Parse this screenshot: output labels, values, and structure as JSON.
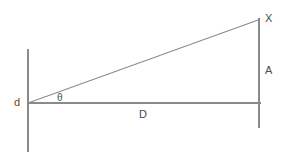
{
  "diagram": {
    "type": "geometry-diagram",
    "canvas": {
      "width": 286,
      "height": 161,
      "background": "#ffffff"
    },
    "stroke_color": "#878787",
    "text_color": "#4c4c4c",
    "labels": {
      "observer": "d",
      "angle": "θ",
      "distance": "D",
      "size": "A",
      "object": "X"
    },
    "geometry": {
      "vertex": {
        "x": 28,
        "y": 103
      },
      "apex": {
        "x": 259,
        "y": 20
      },
      "base_end": {
        "x": 260,
        "y": 103
      },
      "left_axis": {
        "x": 28,
        "y1": 49,
        "y2": 152
      },
      "right_axis": {
        "x": 259,
        "y1": 18,
        "y2": 128
      }
    },
    "label_positions": {
      "observer": {
        "x": 14,
        "y": 97
      },
      "angle": {
        "x": 57,
        "y": 92
      },
      "distance": {
        "x": 139,
        "y": 109
      },
      "size": {
        "x": 265,
        "y": 65
      },
      "object": {
        "x": 265,
        "y": 13
      }
    }
  }
}
